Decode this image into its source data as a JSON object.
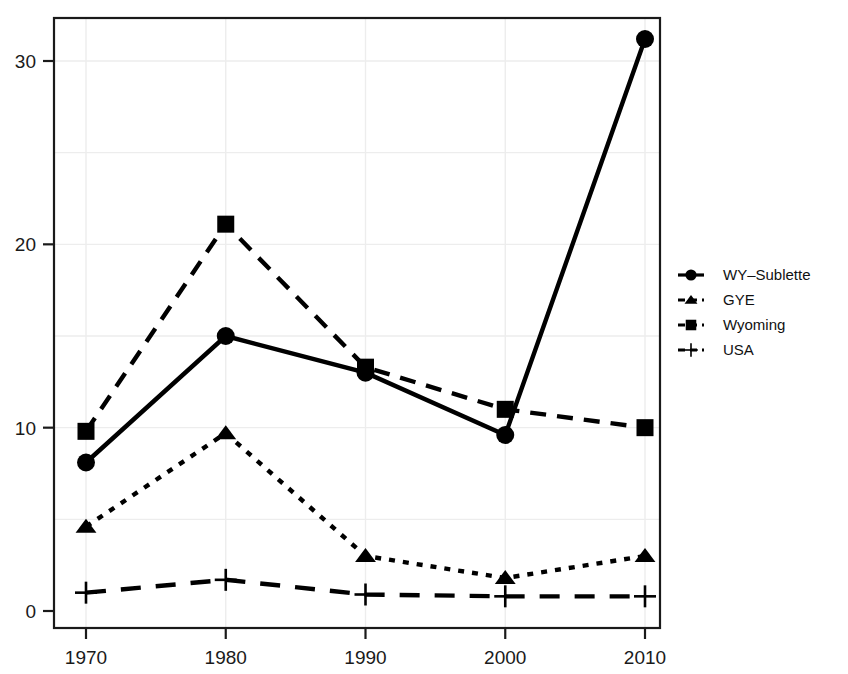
{
  "chart_data": {
    "type": "line",
    "title": "",
    "subtitle": "",
    "xlabel": "",
    "ylabel": "",
    "x": [
      1970,
      1980,
      1990,
      2000,
      2010
    ],
    "xticklabels": [
      "1970",
      "1980",
      "1990",
      "2000",
      "2010"
    ],
    "yticks": [
      0,
      10,
      20,
      30
    ],
    "yticklabels": [
      "0",
      "10",
      "20",
      "30"
    ],
    "xlim": [
      1966,
      2014
    ],
    "ylim": [
      -0.6,
      33.2
    ],
    "grid": "light-gray-minor-and-major",
    "legend_position": "right-outside-middle",
    "series": [
      {
        "name": "WY-Sublette",
        "label": "WY–Sublette",
        "marker": "circle",
        "linestyle": "solid",
        "color": "#000000",
        "values": [
          8.1,
          15.0,
          13.0,
          9.6,
          31.2
        ]
      },
      {
        "name": "GYE",
        "label": "GYE",
        "marker": "triangle",
        "linestyle": "dotted",
        "color": "#000000",
        "values": [
          4.6,
          9.7,
          3.0,
          1.8,
          3.0
        ]
      },
      {
        "name": "Wyoming",
        "label": "Wyoming",
        "marker": "square",
        "linestyle": "dashed",
        "color": "#000000",
        "values": [
          9.8,
          21.1,
          13.3,
          11.0,
          10.0
        ]
      },
      {
        "name": "USA",
        "label": "USA",
        "marker": "plus",
        "linestyle": "dashed-long",
        "color": "#000000",
        "values": [
          1.0,
          1.7,
          0.9,
          0.8,
          0.8
        ]
      }
    ],
    "legend_entries": [
      "WY–Sublette",
      "GYE",
      "Wyoming",
      "USA"
    ],
    "colors": {
      "foreground": "#000000",
      "background": "#ffffff",
      "grid": "#ededed",
      "axis": "#1a1a1a"
    }
  }
}
